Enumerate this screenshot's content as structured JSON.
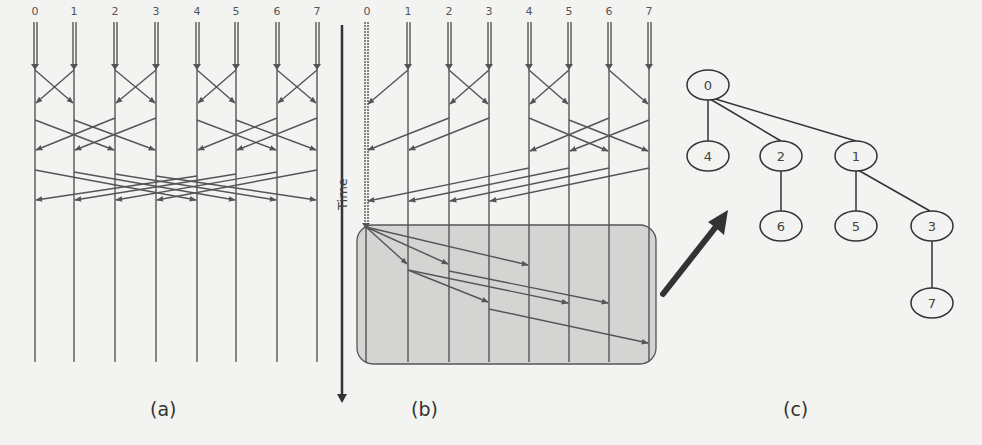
{
  "panels": {
    "a": {
      "caption": "(a)",
      "node_labels": [
        "0",
        "1",
        "2",
        "3",
        "4",
        "5",
        "6",
        "7"
      ]
    },
    "b": {
      "caption": "(b)",
      "node_labels": [
        "0",
        "1",
        "2",
        "3",
        "4",
        "5",
        "6",
        "7"
      ],
      "time_axis_label": "Time"
    },
    "c": {
      "caption": "(c)",
      "tree_nodes": [
        "0",
        "4",
        "2",
        "1",
        "6",
        "5",
        "3",
        "7"
      ]
    }
  },
  "colors": {
    "line": "#555555",
    "box_fill": "#d4d4d2",
    "box_stroke": "#555555",
    "bold": "#333333"
  }
}
